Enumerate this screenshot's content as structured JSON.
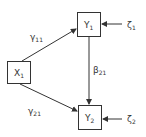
{
  "diagram": {
    "type": "path-diagram",
    "nodes": [
      {
        "id": "X1",
        "label": "X",
        "subscript": "1"
      },
      {
        "id": "Y1",
        "label": "Y",
        "subscript": "1"
      },
      {
        "id": "Y2",
        "label": "Y",
        "subscript": "2"
      }
    ],
    "disturbances": [
      {
        "id": "zeta1",
        "label": "ζ",
        "subscript": "1",
        "target": "Y1"
      },
      {
        "id": "zeta2",
        "label": "ζ",
        "subscript": "2",
        "target": "Y2"
      }
    ],
    "edges": [
      {
        "from": "X1",
        "to": "Y1",
        "label": "γ",
        "subscript": "11"
      },
      {
        "from": "X1",
        "to": "Y2",
        "label": "γ",
        "subscript": "21"
      },
      {
        "from": "Y1",
        "to": "Y2",
        "label": "β",
        "subscript": "21"
      }
    ]
  },
  "colors": {
    "stroke": "#333333",
    "background": "#ffffff"
  }
}
